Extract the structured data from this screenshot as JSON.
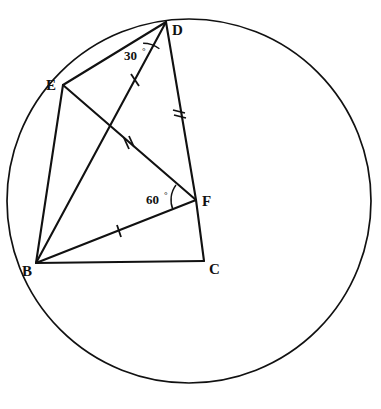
{
  "figure": {
    "background_color": "#ffffff",
    "stroke_color": "#111111"
  },
  "circle": {
    "name": "circumscribed-circle",
    "center_x": 189,
    "center_y": 201,
    "radius": 182
  },
  "points": [
    {
      "id": "B",
      "label": "B",
      "x": 36,
      "y": 263,
      "label_x": 22,
      "label_y": 276,
      "on_circle": true
    },
    {
      "id": "C",
      "label": "C",
      "x": 204,
      "y": 261,
      "label_x": 209,
      "label_y": 274,
      "on_circle": false
    },
    {
      "id": "D",
      "label": "D",
      "x": 166,
      "y": 22,
      "label_x": 172,
      "label_y": 35,
      "on_circle": true
    },
    {
      "id": "E",
      "label": "E",
      "x": 63,
      "y": 85,
      "label_x": 46,
      "label_y": 90,
      "on_circle": true
    },
    {
      "id": "F",
      "label": "F",
      "x": 196,
      "y": 200,
      "label_x": 202,
      "label_y": 206,
      "on_circle": false
    }
  ],
  "segments": [
    {
      "id": "BC",
      "from": "B",
      "to": "C",
      "ticks": 0,
      "name": "segment-bc"
    },
    {
      "id": "BE",
      "from": "B",
      "to": "E",
      "ticks": 0,
      "name": "segment-be"
    },
    {
      "id": "BD",
      "from": "B",
      "to": "D",
      "ticks": 1,
      "name": "segment-bd"
    },
    {
      "id": "BF",
      "from": "B",
      "to": "F",
      "ticks": 1,
      "name": "segment-bf"
    },
    {
      "id": "ED",
      "from": "E",
      "to": "D",
      "ticks": 0,
      "name": "segment-ed"
    },
    {
      "id": "EF",
      "from": "E",
      "to": "F",
      "ticks": 2,
      "name": "segment-ef"
    },
    {
      "id": "DF",
      "from": "D",
      "to": "F",
      "ticks": 2,
      "name": "segment-df"
    },
    {
      "id": "FC",
      "from": "F",
      "to": "C",
      "ticks": 0,
      "name": "segment-fc"
    }
  ],
  "angles": [
    {
      "id": "angle-D",
      "vertex": "D",
      "label": "30",
      "degree_symbol": "°",
      "value": 30,
      "unit": "degrees",
      "rays": [
        "E",
        "B"
      ],
      "label_x": 124,
      "label_y": 60,
      "deg_x": 146,
      "deg_y": 54,
      "arc": {
        "cx": 166,
        "cy": 22,
        "r": 27,
        "start_deg": 212,
        "end_deg": 256
      }
    },
    {
      "id": "angle-F",
      "vertex": "F",
      "label": "60",
      "degree_symbol": "°",
      "value": 60,
      "unit": "degrees",
      "rays": [
        "E",
        "B"
      ],
      "label_x": 146,
      "label_y": 204,
      "deg_x": 168,
      "deg_y": 198,
      "arc": {
        "cx": 196,
        "cy": 200,
        "r": 25,
        "start_deg": 143,
        "end_deg": 203
      }
    }
  ],
  "tick_marks": [
    {
      "segment": "BD",
      "x": 135,
      "y": 80,
      "count": 1,
      "name": "tick-bd"
    },
    {
      "segment": "BF",
      "x": 119,
      "y": 231,
      "count": 1,
      "name": "tick-bf"
    },
    {
      "segment": "EF",
      "x": 128,
      "y": 143,
      "count": 2,
      "name": "tick-ef"
    },
    {
      "segment": "DF",
      "x": 179,
      "y": 112,
      "count": 2,
      "name": "tick-df"
    }
  ]
}
